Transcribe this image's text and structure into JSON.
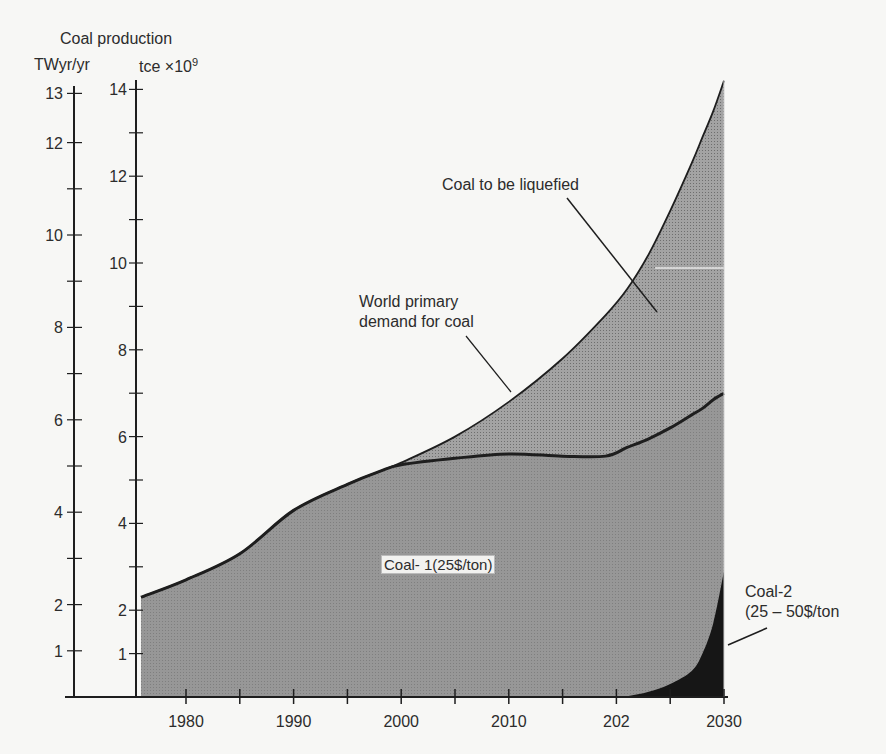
{
  "chart_data": {
    "type": "area",
    "title": "Coal production",
    "axes": {
      "left_outer": {
        "unit_label": "TWyr/yr",
        "ticks": [
          1,
          2,
          4,
          6,
          8,
          10,
          12,
          13
        ],
        "minor_ticks": [
          3,
          5,
          7,
          9,
          11
        ],
        "range": [
          0,
          13
        ]
      },
      "left_inner": {
        "unit_label": "tce ×10⁹",
        "ticks": [
          1,
          2,
          4,
          6,
          8,
          10,
          12,
          14
        ],
        "minor_ticks": [
          3,
          5,
          7,
          9,
          11,
          13
        ],
        "range": [
          0,
          14
        ]
      },
      "x": {
        "tick_labels": [
          "1980",
          "1990",
          "2000",
          "2010",
          "202",
          "2030"
        ],
        "tick_values": [
          1980,
          1990,
          2000,
          2010,
          2020,
          2030
        ],
        "minor_ticks": [
          1985,
          1995,
          2005,
          2015,
          2025
        ],
        "range": [
          1976,
          2030
        ]
      }
    },
    "xlabel": "",
    "ylabel": "Coal production",
    "x": [
      1976,
      1980,
      1985,
      1990,
      1995,
      1998,
      2000,
      2005,
      2010,
      2015,
      2019,
      2021,
      2023,
      2025,
      2027,
      2028,
      2029,
      2030
    ],
    "series": [
      {
        "name": "World primary demand for coal",
        "unit": "tce x10^9",
        "values": [
          2.3,
          2.7,
          3.3,
          4.3,
          4.9,
          5.2,
          5.4,
          6.0,
          6.8,
          7.8,
          8.8,
          9.4,
          10.2,
          11.2,
          12.3,
          12.9,
          13.5,
          14.2
        ]
      },
      {
        "name": "Coal-1 (25$/ton)",
        "unit": "tce x10^9",
        "values": [
          2.3,
          2.7,
          3.3,
          4.3,
          4.9,
          5.2,
          5.35,
          5.5,
          5.6,
          5.55,
          5.55,
          5.75,
          5.95,
          6.2,
          6.5,
          6.65,
          6.85,
          7.0
        ]
      },
      {
        "name": "Coal-2 (25-50$/ton)",
        "unit": "tce x10^9",
        "values": [
          0,
          0,
          0,
          0,
          0,
          0,
          0,
          0,
          0,
          0,
          0,
          0.02,
          0.12,
          0.3,
          0.6,
          1.0,
          1.7,
          2.9
        ]
      }
    ],
    "annotations": [
      {
        "text": "Coal to be liquefied",
        "region": "between demand curve and Coal-1 supply"
      },
      {
        "text": "World primary demand for coal",
        "target": "demand curve"
      },
      {
        "text": "Coal-1(25$/ton)",
        "target": "main shaded area"
      },
      {
        "text": "Coal-2 (25 – 50$/ton",
        "target": "dark area near 2030"
      }
    ],
    "grid": false,
    "legend": "none (inline labels)"
  },
  "labels": {
    "title": "Coal production",
    "left_unit": "TWyr/yr",
    "right_unit": "tce ×10",
    "right_unit_exp": "9",
    "liquefied": "Coal to be liquefied",
    "demand_line1": "World primary",
    "demand_line2": "demand for coal",
    "coal1": "Coal- 1(25$/ton)",
    "coal2_line1": "Coal-2",
    "coal2_line2": "(25 – 50$/ton"
  },
  "colors": {
    "background": "#f7f7f5",
    "area_light": "#a3a3a3",
    "area_coal1": "#8e8e8e",
    "area_coal2": "#161616",
    "lines": "#1e1e1e"
  }
}
